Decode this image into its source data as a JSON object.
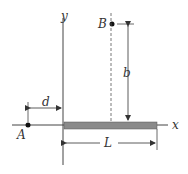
{
  "diagram": {
    "axes": {
      "x_label": "x",
      "y_label": "y"
    },
    "points": [
      {
        "id": "A",
        "label": "A"
      },
      {
        "id": "B",
        "label": "B"
      }
    ],
    "dimensions": {
      "d": "d",
      "b": "b",
      "L": "L"
    },
    "colors": {
      "rod": "#8a8a8a",
      "line": "#444444",
      "point": "#111111"
    }
  }
}
